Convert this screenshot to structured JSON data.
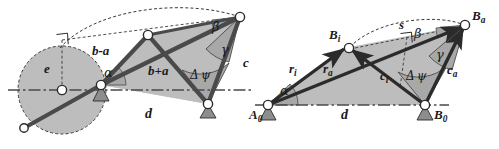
{
  "figure": {
    "colors": {
      "link_fill": "#b7b7b7",
      "link_stroke": "#4a4a4a",
      "polygon_fill": "#bdbdbd",
      "outline": "#2b2b2b",
      "joint_fill": "#ffffff",
      "ground_fill": "#8d8d8d",
      "dashed": "#3a3a3a",
      "angle_fill": "#a8a8a8",
      "background": "#ffffff"
    }
  },
  "left_diagram": {
    "name": "dimensional-diagram",
    "labels": {
      "eccentricity": "e",
      "crank_minus": "b-a",
      "crank_plus": "b+a",
      "coupler": "c",
      "frame": "d",
      "alpha": "α",
      "beta": "β",
      "gamma": "γ",
      "delta_psi_delta": "Δ",
      "delta_psi_psi": "ψ"
    }
  },
  "right_diagram": {
    "name": "vector-diagram",
    "labels": {
      "point_a0_base": "A",
      "point_a0_sub": "0",
      "point_b0_base": "B",
      "point_b0_sub": "0",
      "point_bi_base": "B",
      "point_bi_sub": "i",
      "point_ba_base": "B",
      "point_ba_sub": "a",
      "vector_ri_base": "r",
      "vector_ri_sub": "i",
      "vector_ra_base": "r",
      "vector_ra_sub": "a",
      "vector_ci_base": "c",
      "vector_ci_sub": "i",
      "vector_ca_base": "c",
      "vector_ca_sub": "a",
      "frame": "d",
      "chord": "s",
      "alpha": "α",
      "beta": "β",
      "gamma": "γ",
      "delta_psi_delta": "Δ",
      "delta_psi_psi": "ψ"
    }
  }
}
